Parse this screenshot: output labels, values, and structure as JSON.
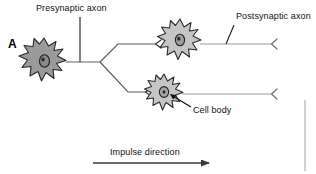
{
  "figure": {
    "panel_letter": "A",
    "type": "biological-diagram",
    "background_color": "#ffffff",
    "line_color": "#6b6b6b",
    "dark_line_color": "#1a1a1a",
    "cell_fill_presynaptic": "#9a9a9a",
    "cell_fill_postsynaptic": "#c3c3c3",
    "cell_outline_color": "#2a2a2a",
    "nucleus_fill": "#8a8a8a"
  },
  "labels": {
    "presynaptic_axon": "Presynaptic axon",
    "postsynaptic_axon": "Postsynaptic axon",
    "cell_body": "Cell body",
    "impulse_direction": "Impulse direction"
  },
  "structures": {
    "presynaptic_neuron": {
      "name": "presynaptic-neuron-soma",
      "cx": 44,
      "cy": 61
    },
    "postsynaptic_neuron_upper": {
      "name": "postsynaptic-neuron-soma-upper",
      "cx": 180,
      "cy": 41
    },
    "postsynaptic_neuron_lower": {
      "name": "postsynaptic-neuron-soma-lower",
      "cx": 164,
      "cy": 93
    },
    "branch_point": {
      "x": 100,
      "y": 62
    },
    "axon_terminal_upper": {
      "x": 271,
      "y": 45
    },
    "axon_terminal_lower": {
      "x": 271,
      "y": 95
    }
  },
  "arrow": {
    "name": "impulse-direction-arrow",
    "x_start": 93,
    "x_end": 213,
    "y": 163
  }
}
